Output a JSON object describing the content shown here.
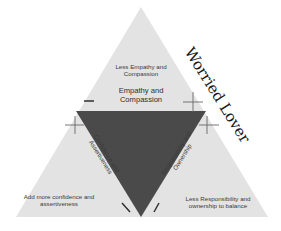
{
  "title": "Worried Lover",
  "colors": {
    "outer_triangle": "#e3e3e3",
    "inner_triangle": "#4a4a4a",
    "marker": "#555555",
    "text": "#3a3a3a",
    "title_text": "#1a1a1a"
  },
  "top_section": {
    "note": "Less Empathy and Compassion",
    "edge_label": "Empathy and Compassion"
  },
  "left_section": {
    "edge_label": "Confidence and Assertiveness",
    "note": "Add more confidence and assertiveness"
  },
  "right_section": {
    "edge_label": "Responsibility and Ownership",
    "note": "Less Responsibility and ownership to balance"
  },
  "markers": {
    "top_left": "−",
    "top_right": "+",
    "left_upper": "+",
    "right_upper": "+",
    "bottom_left": "\\",
    "bottom_right": "/"
  }
}
